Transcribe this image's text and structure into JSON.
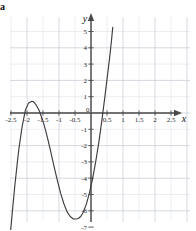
{
  "figure": {
    "corner_label": "a",
    "background_color": "#ffffff",
    "grid_color": "#d8dce4",
    "grid_major_color": "#c3c8d2",
    "axis_color": "#4a4a4a",
    "curve_color": "#3d3d3d",
    "x_axis_name": "x",
    "y_axis_name": "y"
  },
  "chart_data": {
    "type": "line",
    "title": "",
    "xlabel": "x",
    "ylabel": "y",
    "xlim": [
      -2.8,
      2.9
    ],
    "ylim": [
      -7.4,
      5.6
    ],
    "grid": true,
    "grid_step_x": 0.5,
    "grid_step_y": 1,
    "legend": "none",
    "x_ticks": [
      -2.5,
      -2,
      -1.5,
      -1,
      -0.5,
      0,
      0.5,
      1,
      1.5,
      2,
      2.5
    ],
    "x_tick_labels": [
      "-2.5",
      "-2",
      "-1.5",
      "-1",
      "-0.5",
      "0",
      "0.5",
      "1",
      "1.5",
      "2",
      "2.5"
    ],
    "y_ticks": [
      -7,
      -6,
      -5,
      -4,
      -3,
      -2,
      -1,
      1,
      2,
      3,
      4,
      5
    ],
    "y_tick_labels": [
      "-7",
      "-6",
      "-5",
      "-4",
      "-3",
      "-2",
      "-1",
      "1",
      "2",
      "3",
      "4",
      "5"
    ],
    "series": [
      {
        "name": "cubic",
        "x": [
          -2.52,
          -2.45,
          -2.38,
          -2.3,
          -2.25,
          -2.15,
          -2.05,
          -1.95,
          -1.85,
          -1.8,
          -1.72,
          -1.62,
          -1.52,
          -1.42,
          -1.35,
          -1.25,
          -1.15,
          -1.05,
          -0.95,
          -0.85,
          -0.75,
          -0.65,
          -0.55,
          -0.45,
          -0.4,
          -0.32,
          -0.25,
          -0.15,
          -0.05,
          0.05,
          0.15,
          0.25,
          0.35,
          0.45,
          0.52,
          0.58,
          0.64,
          0.68
        ],
        "y": [
          -7.4,
          -5.9,
          -4.45,
          -3.0,
          -2.15,
          -0.8,
          0.18,
          0.62,
          0.72,
          0.7,
          0.52,
          0.15,
          -0.38,
          -1.05,
          -1.6,
          -2.45,
          -3.32,
          -4.15,
          -4.92,
          -5.55,
          -6.05,
          -6.35,
          -6.5,
          -6.5,
          -6.47,
          -6.35,
          -6.12,
          -5.62,
          -4.92,
          -4.02,
          -2.95,
          -1.72,
          -0.3,
          1.25,
          2.4,
          3.35,
          4.45,
          5.25
        ]
      }
    ],
    "key_points": {
      "local_max": {
        "x": -1.82,
        "y": 0.72
      },
      "local_min": {
        "x": -0.42,
        "y": -6.5
      },
      "x_intercepts": [
        -2.25,
        -1.35,
        0.45
      ],
      "y_intercept": -4.0
    }
  }
}
